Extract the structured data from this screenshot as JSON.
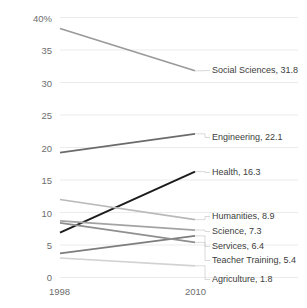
{
  "chart_data": {
    "type": "line",
    "title": "",
    "xlabel": "",
    "ylabel": "",
    "x": [
      1998,
      2010
    ],
    "xtick_labels": [
      "1998",
      "2010"
    ],
    "ylim": [
      0,
      40
    ],
    "ytick_labels": [
      "0",
      "5",
      "10",
      "15",
      "20",
      "25",
      "30",
      "35",
      "40%"
    ],
    "ytick_values": [
      0,
      5,
      10,
      15,
      20,
      25,
      30,
      35,
      40
    ],
    "grid": true,
    "grid_axis": "y",
    "legend_position": "right-inline-labels",
    "value_unit": "percent",
    "series": [
      {
        "name": "Social Sciences",
        "values": [
          38.3,
          31.8
        ],
        "label": "Social Sciences, 31.8",
        "color": "#9a9a9a"
      },
      {
        "name": "Engineering",
        "values": [
          19.2,
          22.1
        ],
        "label": "Engineering, 22.1",
        "color": "#6b6b6b"
      },
      {
        "name": "Health",
        "values": [
          6.9,
          16.3
        ],
        "label": "Health, 16.3",
        "color": "#1c1c1c"
      },
      {
        "name": "Humanities",
        "values": [
          12.0,
          8.9
        ],
        "label": "Humanities, 8.9",
        "color": "#b9b9b9"
      },
      {
        "name": "Science",
        "values": [
          8.7,
          7.3
        ],
        "label": "Science, 7.3",
        "color": "#a3a3a3"
      },
      {
        "name": "Services",
        "values": [
          3.7,
          6.4
        ],
        "label": "Services, 6.4",
        "color": "#7d7d7d"
      },
      {
        "name": "Teacher Training",
        "values": [
          8.4,
          5.4
        ],
        "label": "Teacher Training, 5.4",
        "color": "#8f8f8f"
      },
      {
        "name": "Agriculture",
        "values": [
          3.0,
          1.8
        ],
        "label": "Agriculture, 1.8",
        "color": "#d2d2d2"
      }
    ]
  },
  "axis": {
    "y": {
      "t40": "40%",
      "t35": "35",
      "t30": "30",
      "t25": "25",
      "t20": "20",
      "t15": "15",
      "t10": "10",
      "t5": "5",
      "t0": "0"
    },
    "x": {
      "left": "1998",
      "right": "2010"
    }
  },
  "labels": {
    "social_sciences": "Social Sciences, 31.8",
    "engineering": "Engineering, 22.1",
    "health": "Health, 16.3",
    "humanities": "Humanities, 8.9",
    "science": "Science, 7.3",
    "services": "Services, 6.4",
    "teacher_training": "Teacher Training, 5.4",
    "agriculture": "Agriculture, 1.8"
  },
  "style": {
    "grid_color": "#ebebeb",
    "axis_text_color": "#6e6e6e",
    "label_text_color": "#3d3d3d",
    "background": "#ffffff"
  }
}
